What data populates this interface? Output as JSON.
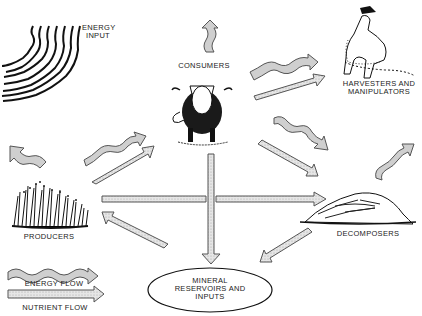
{
  "nodes": {
    "energy_input": {
      "label_line1": "ENERGY",
      "label_line2": "INPUT"
    },
    "consumers": {
      "label": "CONSUMERS"
    },
    "harvesters": {
      "label_line1": "HARVESTERS AND",
      "label_line2": "MANIPULATORS"
    },
    "producers": {
      "label": "PRODUCERS"
    },
    "decomposers": {
      "label": "DECOMPOSERS"
    },
    "minerals": {
      "label_line1": "MINERAL",
      "label_line2": "RESERVOIRS AND",
      "label_line3": "INPUTS"
    }
  },
  "legend": {
    "energy_flow": "ENERGY FLOW",
    "nutrient_flow": "NUTRIENT FLOW"
  },
  "edges": [
    {
      "from": "energy_input",
      "to": "producers",
      "type": "energy"
    },
    {
      "from": "producers",
      "to": "consumers",
      "type": "energy"
    },
    {
      "from": "producers",
      "to": "consumers",
      "type": "nutrient"
    },
    {
      "from": "producers",
      "to": "decomposers",
      "type": "nutrient"
    },
    {
      "from": "producers",
      "to": "outside",
      "type": "energy"
    },
    {
      "from": "consumers",
      "to": "outside",
      "type": "energy"
    },
    {
      "from": "consumers",
      "to": "harvesters",
      "type": "energy"
    },
    {
      "from": "consumers",
      "to": "harvesters",
      "type": "nutrient"
    },
    {
      "from": "consumers",
      "to": "decomposers",
      "type": "energy"
    },
    {
      "from": "consumers",
      "to": "decomposers",
      "type": "nutrient"
    },
    {
      "from": "consumers",
      "to": "minerals",
      "type": "nutrient"
    },
    {
      "from": "decomposers",
      "to": "outside",
      "type": "energy"
    },
    {
      "from": "decomposers",
      "to": "minerals",
      "type": "nutrient"
    },
    {
      "from": "minerals",
      "to": "producers",
      "type": "nutrient"
    }
  ],
  "colors": {
    "arrow_fill": "#cfcfcf",
    "arrow_stroke": "#555555",
    "ink": "#1a1a1a"
  }
}
